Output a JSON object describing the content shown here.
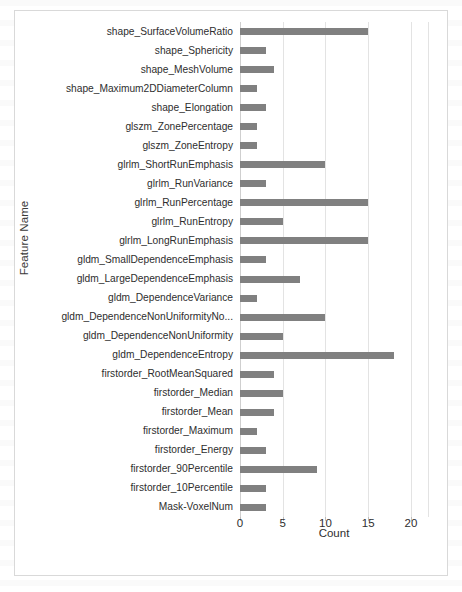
{
  "chart_data": {
    "type": "bar",
    "orientation": "horizontal",
    "title": "",
    "xlabel": "Count",
    "ylabel": "Feature Name",
    "xlim": [
      0,
      22
    ],
    "xticks": [
      0,
      5,
      10,
      15,
      20
    ],
    "xtick_labels": [
      "0",
      "5",
      "10",
      "15",
      "20"
    ],
    "grid": true,
    "grid_axis": "x",
    "legend": false,
    "bar_color": "#808080",
    "categories": [
      "shape_SurfaceVolumeRatio",
      "shape_Sphericity",
      "shape_MeshVolume",
      "shape_Maximum2DDiameterColumn",
      "shape_Elongation",
      "glszm_ZonePercentage",
      "glszm_ZoneEntropy",
      "glrlm_ShortRunEmphasis",
      "glrlm_RunVariance",
      "glrlm_RunPercentage",
      "glrlm_RunEntropy",
      "glrlm_LongRunEmphasis",
      "gldm_SmallDependenceEmphasis",
      "gldm_LargeDependenceEmphasis",
      "gldm_DependenceVariance",
      "gldm_DependenceNonUniformityNo...",
      "gldm_DependenceNonUniformity",
      "gldm_DependenceEntropy",
      "firstorder_RootMeanSquared",
      "firstorder_Median",
      "firstorder_Mean",
      "firstorder_Maximum",
      "firstorder_Energy",
      "firstorder_90Percentile",
      "firstorder_10Percentile",
      "Mask-VoxelNum"
    ],
    "values": [
      15,
      3,
      4,
      2,
      3,
      2,
      2,
      10,
      3,
      15,
      5,
      15,
      3,
      7,
      2,
      10,
      5,
      18,
      4,
      5,
      4,
      2,
      3,
      9,
      3,
      3
    ]
  }
}
